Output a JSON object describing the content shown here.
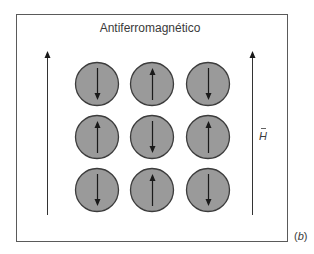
{
  "figure": {
    "title": "Antiferromagnético",
    "field_label": "H",
    "field_vector_mark": "→",
    "panel_label_open": "(",
    "panel_label_letter": "b",
    "panel_label_close": ")",
    "colors": {
      "frame": "#5a5a5a",
      "sphere_fill": "#9a9a9a",
      "sphere_stroke": "#3c3c3c",
      "arrow": "#1a1a1a",
      "text": "#3a3a3a"
    }
  },
  "lattice": {
    "rows": 3,
    "cols": 3,
    "spins": [
      [
        "down",
        "up",
        "down"
      ],
      [
        "up",
        "down",
        "up"
      ],
      [
        "down",
        "up",
        "down"
      ]
    ]
  },
  "field_arrows": [
    {
      "side": "left",
      "direction": "up"
    },
    {
      "side": "right",
      "direction": "up"
    }
  ]
}
